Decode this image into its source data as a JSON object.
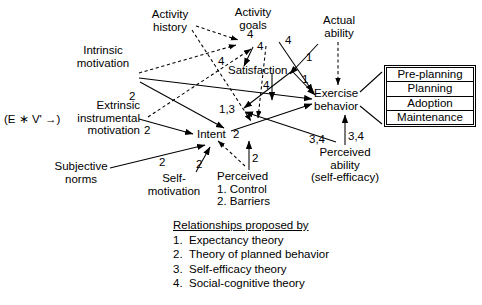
{
  "diagram": {
    "nodes": {
      "activity_history": "Activity\nhistory",
      "activity_goals": "Activity\ngoals",
      "actual_ability": "Actual\nability",
      "intrinsic_motivation": "Intrinsic\nmotivation",
      "satisfaction": "Satisfaction",
      "exercise_behavior": "Exercise\nbehavior",
      "extrinsic_motivation": "Extrinsic\ninstrumental\nmotivation",
      "ev_expression": "(E ∗ V' →)",
      "intent": "Intent",
      "subjective_norms": "Subjective\nnorms",
      "self_motivation": "Self-\nmotivation",
      "perceived_control": "Perceived\n1.  Control\n2.  Barriers",
      "perceived_ability": "Perceived\nability\n(self-efficacy)"
    },
    "edge_labels": [
      {
        "id": "goals-to-satisfaction",
        "text": "4"
      },
      {
        "id": "goals-to-exercise",
        "text": "4"
      },
      {
        "id": "history-to-goals",
        "text": "4"
      },
      {
        "id": "satisfaction-to-exercise-1",
        "text": "1"
      },
      {
        "id": "actual-ability-to-exercise",
        "text": "1"
      },
      {
        "id": "intrinsic-out",
        "text": "2"
      },
      {
        "id": "satisfaction-down",
        "text": "4"
      },
      {
        "id": "intent-path",
        "text": "1,3"
      },
      {
        "id": "extrinsic-to-intent",
        "text": "2"
      },
      {
        "id": "intent-out",
        "text": "2"
      },
      {
        "id": "subjective-to-intent",
        "text": "2"
      },
      {
        "id": "selfmotivation-to-intent",
        "text": "2"
      },
      {
        "id": "perceived-control-to-intent",
        "text": "2"
      },
      {
        "id": "perceived-ability-to-intent",
        "text": "3,4"
      },
      {
        "id": "perceived-ability-to-exercise",
        "text": "3,4"
      }
    ],
    "stage_box": {
      "name": "exercise-stages",
      "rows": [
        "Pre-planning",
        "Planning",
        "Adoption",
        "Maintenance"
      ]
    },
    "legend": {
      "title": "Relationships proposed by",
      "items": [
        {
          "num": "1.",
          "label": "Expectancy theory"
        },
        {
          "num": "2.",
          "label": "Theory of planned behavior"
        },
        {
          "num": "3.",
          "label": "Self-efficacy theory"
        },
        {
          "num": "4.",
          "label": "Social-cognitive theory"
        }
      ]
    },
    "colors": {
      "ink": "#000000",
      "paper": "#ffffff"
    }
  }
}
